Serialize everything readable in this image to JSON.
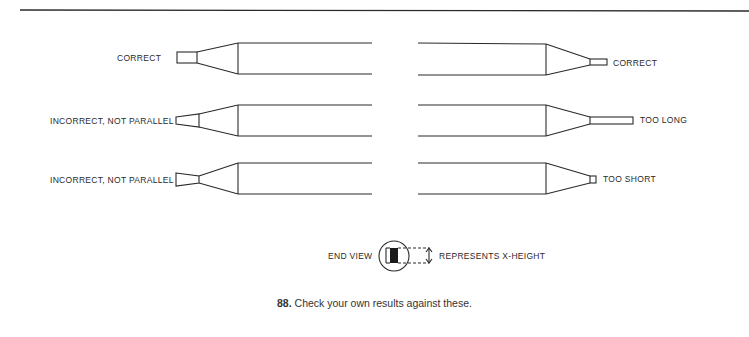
{
  "figure": {
    "number": "88.",
    "caption": "Check your own results against these.",
    "left_column": [
      {
        "label": "CORRECT",
        "tip": "parallel-rectangle"
      },
      {
        "label": "INCORRECT, NOT PARALLEL",
        "tip": "tapered-wide-left"
      },
      {
        "label": "INCORRECT, NOT PARALLEL",
        "tip": "tapered-narrow-left"
      }
    ],
    "right_column": [
      {
        "label": "CORRECT",
        "tip": "parallel-rectangle"
      },
      {
        "label": "TOO LONG",
        "tip": "long-rectangle"
      },
      {
        "label": "TOO SHORT",
        "tip": "short-square"
      }
    ],
    "end_view": {
      "label": "END VIEW",
      "annotation": "REPRESENTS X-HEIGHT"
    }
  }
}
